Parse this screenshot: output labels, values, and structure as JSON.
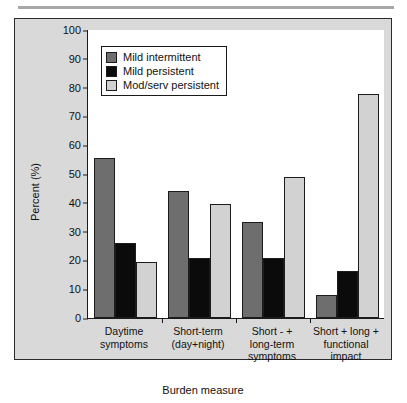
{
  "chart_data": {
    "type": "bar",
    "title": "",
    "xlabel": "Burden measure",
    "ylabel": "Percent (%)",
    "ylim": [
      0,
      100
    ],
    "yticks": [
      0,
      10,
      20,
      30,
      40,
      50,
      60,
      70,
      80,
      90,
      100
    ],
    "ytick_labels": [
      "0",
      "10",
      "20",
      "30",
      "40",
      "50",
      "60",
      "70",
      "80",
      "90",
      "100"
    ],
    "grid": false,
    "legend_position": "top-left-inside",
    "categories": [
      "Daytime\nsymptoms",
      "Short-term\n(day+night)",
      "Short - +\nlong-term\nsymptoms",
      "Short + long +\nfunctional\nimpact"
    ],
    "series": [
      {
        "name": "Mild intermittent",
        "color": "#6e6e6e",
        "values": [
          55.5,
          44.0,
          33.3,
          8.0
        ]
      },
      {
        "name": "Mild persistent",
        "color": "#0b0b0b",
        "values": [
          26.0,
          21.0,
          20.7,
          16.4
        ]
      },
      {
        "name": "Mod/serv persistent",
        "color": "#d2d2d2",
        "values": [
          19.3,
          39.6,
          48.8,
          77.8
        ]
      }
    ]
  },
  "figure": {
    "panel_background": "#d9d9d9",
    "plot_background": "#ffffff",
    "axis_color": "#1a1a1a",
    "border_color": "#2b2b2b"
  }
}
